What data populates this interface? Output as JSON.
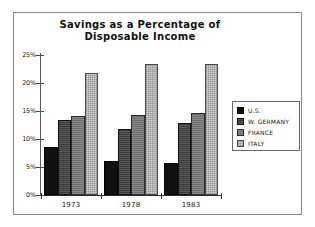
{
  "chart_data": {
    "type": "bar",
    "title": "Savings as a Percentage of\nDisposable Income",
    "xlabel": "",
    "ylabel": "",
    "categories": [
      "1973",
      "1978",
      "1983"
    ],
    "series": [
      {
        "name": "U.S.",
        "color": "#111111",
        "values": [
          8.6,
          6.0,
          5.7
        ]
      },
      {
        "name": "W. GERMANY",
        "color": "#3a3a3a",
        "values": [
          13.4,
          11.8,
          12.8
        ]
      },
      {
        "name": "FRANCE",
        "color": "#6e6e6e",
        "values": [
          14.1,
          14.2,
          14.7
        ]
      },
      {
        "name": "ITALY",
        "color": "#d4d4d4",
        "values": [
          21.8,
          23.4,
          23.4
        ]
      }
    ],
    "ylim": [
      0,
      25
    ],
    "ytick_values": [
      0,
      5,
      10,
      15,
      20,
      25
    ],
    "ytick_labels": [
      "0%",
      "5%",
      "10%",
      "15%",
      "20%",
      "25%"
    ],
    "grid": false,
    "legend_position": "right"
  },
  "legend": {
    "entries": [
      {
        "label": "U.S."
      },
      {
        "label": "W. GERMANY"
      },
      {
        "label": "FRANCE"
      },
      {
        "label": "ITALY"
      }
    ]
  }
}
